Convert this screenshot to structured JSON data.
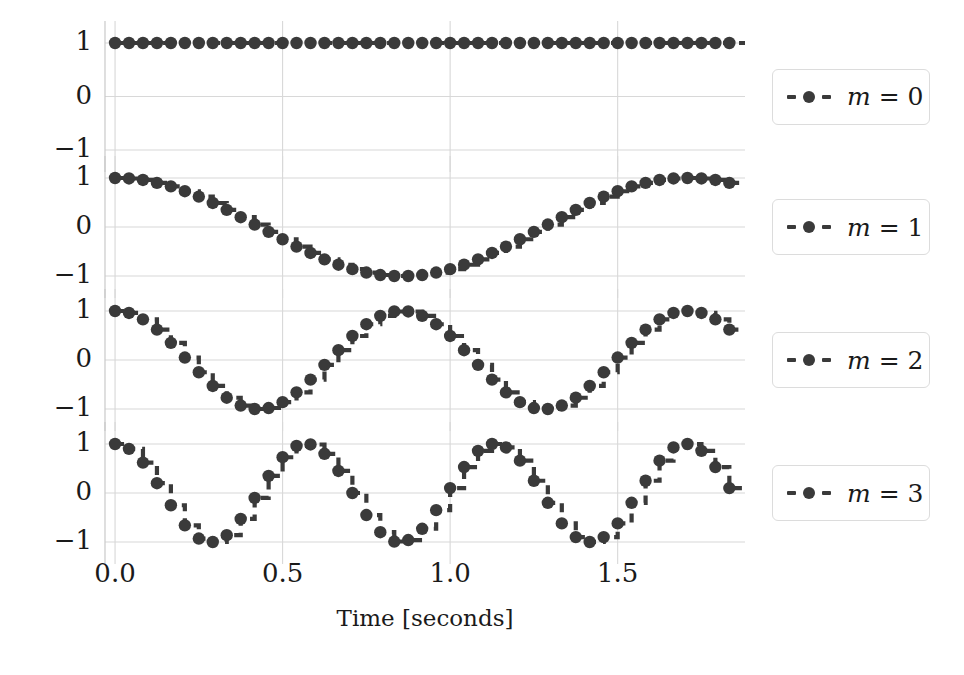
{
  "figure": {
    "background": "#ffffff",
    "line_color": "#3a3a3a",
    "grid_color": "#d8d8d8",
    "axis_color": "#cccccc",
    "text_color": "#1a1a1a"
  },
  "xaxis": {
    "label": "Time [seconds]",
    "ticks": [
      "0.0",
      "0.5",
      "1.0",
      "1.5"
    ],
    "tick_values": [
      0.0,
      0.5,
      1.0,
      1.5
    ],
    "range": [
      -0.03,
      1.88
    ]
  },
  "yaxis": {
    "ticks": [
      "1",
      "0",
      "−1"
    ],
    "tick_values": [
      1,
      0,
      -1
    ],
    "range": [
      -1.35,
      1.35
    ]
  },
  "legend": {
    "entries": [
      {
        "label": "m = 0",
        "marker": "circle",
        "linestyle": "dashed"
      },
      {
        "label": "m = 1",
        "marker": "circle",
        "linestyle": "dashed"
      },
      {
        "label": "m = 2",
        "marker": "circle",
        "linestyle": "dashed"
      },
      {
        "label": "m = 3",
        "marker": "circle",
        "linestyle": "dashed"
      }
    ]
  },
  "caption": {
    "text": ""
  },
  "chart_data": {
    "type": "line",
    "title": "",
    "subtitle": "",
    "xlabel": "Time [seconds]",
    "ylabel": "",
    "xlim": [
      -0.03,
      1.88
    ],
    "ylim": [
      -1.35,
      1.35
    ],
    "grid": true,
    "legend_position": "right",
    "drawstyle": "steps-post",
    "marker": "circle",
    "sample_interval": 0.0416,
    "subplot_layout": "4x1 stacked",
    "x": [
      0.0,
      0.0416,
      0.0833,
      0.125,
      0.1666,
      0.2083,
      0.25,
      0.2916,
      0.3333,
      0.375,
      0.4166,
      0.4583,
      0.5,
      0.5416,
      0.5833,
      0.625,
      0.6666,
      0.7083,
      0.75,
      0.7916,
      0.8333,
      0.875,
      0.9166,
      0.9583,
      1.0,
      1.0416,
      1.0833,
      1.125,
      1.1666,
      1.2083,
      1.25,
      1.2916,
      1.3333,
      1.375,
      1.4166,
      1.4583,
      1.5,
      1.5416,
      1.5833,
      1.625,
      1.6666,
      1.7083,
      1.75,
      1.7916,
      1.8333
    ],
    "series": [
      {
        "name": "m = 0",
        "frequency_hz": 0.0,
        "formula": "cos(2*pi*0*t) = 1",
        "values": [
          1,
          1,
          1,
          1,
          1,
          1,
          1,
          1,
          1,
          1,
          1,
          1,
          1,
          1,
          1,
          1,
          1,
          1,
          1,
          1,
          1,
          1,
          1,
          1,
          1,
          1,
          1,
          1,
          1,
          1,
          1,
          1,
          1,
          1,
          1,
          1,
          1,
          1,
          1,
          1,
          1,
          1,
          1,
          1,
          1
        ]
      },
      {
        "name": "m = 1",
        "frequency_hz": 0.54,
        "formula": "cos(2*pi*0.54*t)",
        "values": [
          1.0,
          0.99,
          0.96,
          0.9,
          0.83,
          0.73,
          0.62,
          0.49,
          0.35,
          0.2,
          0.05,
          -0.1,
          -0.25,
          -0.4,
          -0.53,
          -0.66,
          -0.77,
          -0.86,
          -0.93,
          -0.98,
          -1.0,
          -1.0,
          -0.98,
          -0.93,
          -0.86,
          -0.77,
          -0.66,
          -0.53,
          -0.4,
          -0.25,
          -0.1,
          0.05,
          0.2,
          0.35,
          0.49,
          0.62,
          0.73,
          0.83,
          0.9,
          0.96,
          0.99,
          1.0,
          0.99,
          0.96,
          0.9
        ]
      },
      {
        "name": "m = 2",
        "frequency_hz": 1.08,
        "formula": "cos(2*pi*1.08*t)",
        "values": [
          1.0,
          0.96,
          0.83,
          0.62,
          0.35,
          0.05,
          -0.25,
          -0.53,
          -0.77,
          -0.93,
          -1.0,
          -0.98,
          -0.86,
          -0.66,
          -0.4,
          -0.1,
          0.2,
          0.49,
          0.73,
          0.9,
          0.99,
          0.99,
          0.9,
          0.73,
          0.49,
          0.2,
          -0.1,
          -0.4,
          -0.66,
          -0.86,
          -0.98,
          -1.0,
          -0.93,
          -0.77,
          -0.53,
          -0.25,
          0.05,
          0.35,
          0.62,
          0.83,
          0.96,
          1.0,
          0.96,
          0.83,
          0.62
        ]
      },
      {
        "name": "m = 3",
        "frequency_hz": 1.62,
        "formula": "cos(2*pi*1.62*t)",
        "values": [
          1.0,
          0.9,
          0.62,
          0.2,
          -0.25,
          -0.66,
          -0.93,
          -1.0,
          -0.86,
          -0.53,
          -0.1,
          0.35,
          0.73,
          0.96,
          0.99,
          0.8,
          0.45,
          0.0,
          -0.45,
          -0.8,
          -0.99,
          -0.96,
          -0.73,
          -0.35,
          0.1,
          0.53,
          0.86,
          1.0,
          0.93,
          0.66,
          0.25,
          -0.2,
          -0.62,
          -0.9,
          -1.0,
          -0.9,
          -0.62,
          -0.2,
          0.25,
          0.66,
          0.93,
          1.0,
          0.86,
          0.53,
          0.1
        ]
      }
    ]
  }
}
